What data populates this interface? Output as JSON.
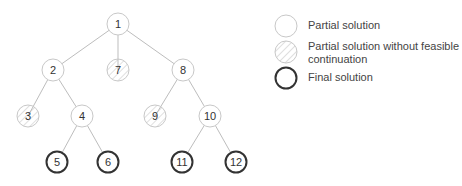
{
  "diagram": {
    "type": "tree",
    "colors": {
      "edge": "#bdbdbd",
      "partial_border": "#c8c8c8",
      "final_border": "#333333",
      "hatch": "#a0a0a0",
      "label": "#333333"
    },
    "nodes": [
      {
        "id": "1",
        "label": "1",
        "x": 118,
        "y": 24,
        "kind": "partial"
      },
      {
        "id": "2",
        "label": "2",
        "x": 53,
        "y": 70,
        "kind": "partial"
      },
      {
        "id": "7",
        "label": "7",
        "x": 118,
        "y": 70,
        "kind": "infeasible"
      },
      {
        "id": "8",
        "label": "8",
        "x": 183,
        "y": 70,
        "kind": "partial"
      },
      {
        "id": "3",
        "label": "3",
        "x": 28,
        "y": 116,
        "kind": "infeasible"
      },
      {
        "id": "4",
        "label": "4",
        "x": 82,
        "y": 116,
        "kind": "partial"
      },
      {
        "id": "9",
        "label": "9",
        "x": 155,
        "y": 116,
        "kind": "infeasible"
      },
      {
        "id": "10",
        "label": "10",
        "x": 210,
        "y": 116,
        "kind": "partial"
      },
      {
        "id": "5",
        "label": "5",
        "x": 57,
        "y": 162,
        "kind": "final"
      },
      {
        "id": "6",
        "label": "6",
        "x": 108,
        "y": 162,
        "kind": "final"
      },
      {
        "id": "11",
        "label": "11",
        "x": 182,
        "y": 162,
        "kind": "final"
      },
      {
        "id": "12",
        "label": "12",
        "x": 236,
        "y": 162,
        "kind": "final"
      }
    ],
    "edges": [
      [
        "1",
        "2"
      ],
      [
        "1",
        "7"
      ],
      [
        "1",
        "8"
      ],
      [
        "2",
        "3"
      ],
      [
        "2",
        "4"
      ],
      [
        "8",
        "9"
      ],
      [
        "8",
        "10"
      ],
      [
        "4",
        "5"
      ],
      [
        "4",
        "6"
      ],
      [
        "10",
        "11"
      ],
      [
        "10",
        "12"
      ]
    ]
  },
  "legend": {
    "items": [
      {
        "kind": "partial",
        "label": "Partial solution"
      },
      {
        "kind": "infeasible",
        "label": "Partial solution without feasible continuation"
      },
      {
        "kind": "final",
        "label": "Final solution"
      }
    ]
  }
}
